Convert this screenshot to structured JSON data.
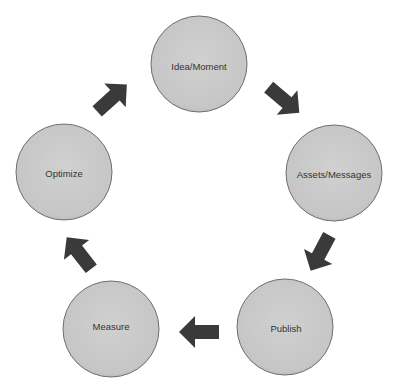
{
  "diagram": {
    "type": "cycle",
    "colors": {
      "circle_fill": "#c9c9c9",
      "circle_stroke": "#6e6e6e",
      "arrow_fill": "#3a3a3a",
      "text": "#333333"
    },
    "nodes": [
      {
        "id": "idea",
        "label": "Idea/Moment",
        "cx": 199,
        "cy": 64,
        "r": 48
      },
      {
        "id": "assets",
        "label": "Assets/Messages",
        "cx": 334,
        "cy": 173,
        "r": 48
      },
      {
        "id": "publish",
        "label": "Publish",
        "cx": 285,
        "cy": 327,
        "r": 48
      },
      {
        "id": "measure",
        "label": "Measure",
        "cx": 111,
        "cy": 329,
        "r": 48
      },
      {
        "id": "optimize",
        "label": "Optimize",
        "cx": 64,
        "cy": 172,
        "r": 48
      }
    ],
    "edges": [
      {
        "from": "idea",
        "to": "assets"
      },
      {
        "from": "assets",
        "to": "publish"
      },
      {
        "from": "publish",
        "to": "measure"
      },
      {
        "from": "measure",
        "to": "optimize"
      },
      {
        "from": "optimize",
        "to": "idea"
      }
    ]
  }
}
